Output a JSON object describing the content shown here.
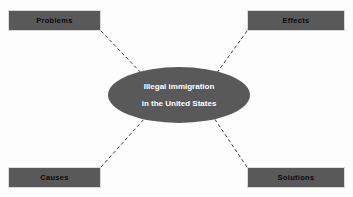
{
  "diagram": {
    "type": "concept-map",
    "background_color": "#fdfdfd",
    "node_fill_color": "#595959",
    "node_border_color": "#d9d9d9",
    "box_label_color": "#0a0a0a",
    "center_text_color": "#ffffff",
    "connector_color": "#3f3f3f",
    "connector_style": "dashed",
    "center": {
      "shape": "ellipse",
      "line1": "Illegal immigration",
      "line2": "in the United States"
    },
    "nodes": [
      {
        "id": "problems",
        "label": "Problems",
        "position": "top-left"
      },
      {
        "id": "effects",
        "label": "Effects",
        "position": "top-right"
      },
      {
        "id": "causes",
        "label": "Causes",
        "position": "bottom-left"
      },
      {
        "id": "solutions",
        "label": "Solutions",
        "position": "bottom-right"
      }
    ],
    "connectors": [
      {
        "from": "problems",
        "to": "center"
      },
      {
        "from": "effects",
        "to": "center"
      },
      {
        "from": "causes",
        "to": "center"
      },
      {
        "from": "solutions",
        "to": "center"
      }
    ]
  }
}
